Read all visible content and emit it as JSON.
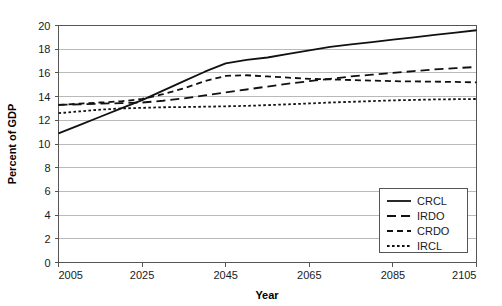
{
  "chart_data": {
    "type": "line",
    "title": "",
    "xlabel": "Year",
    "ylabel": "Percent of GDP",
    "xlim": [
      2005,
      2105
    ],
    "ylim": [
      0,
      20
    ],
    "xticks": [
      2005,
      2025,
      2045,
      2065,
      2085,
      2105
    ],
    "yticks": [
      0,
      2,
      4,
      6,
      8,
      10,
      12,
      14,
      16,
      18,
      20
    ],
    "grid": "horizontal",
    "legend_position": "bottom-right",
    "x": [
      2005,
      2010,
      2015,
      2020,
      2025,
      2030,
      2035,
      2040,
      2045,
      2050,
      2055,
      2060,
      2065,
      2070,
      2075,
      2080,
      2085,
      2090,
      2095,
      2100,
      2105
    ],
    "series": [
      {
        "name": "CRCL",
        "style": "solid",
        "values": [
          10.9,
          11.6,
          12.3,
          13.0,
          13.7,
          14.5,
          15.3,
          16.1,
          16.8,
          17.1,
          17.3,
          17.6,
          17.9,
          18.2,
          18.4,
          18.6,
          18.8,
          19.0,
          19.2,
          19.4,
          19.6
        ]
      },
      {
        "name": "IRDO",
        "style": "long-dash",
        "values": [
          13.3,
          13.35,
          13.4,
          13.45,
          13.5,
          13.65,
          13.85,
          14.1,
          14.35,
          14.6,
          14.85,
          15.1,
          15.3,
          15.5,
          15.7,
          15.85,
          16.0,
          16.15,
          16.3,
          16.4,
          16.5
        ]
      },
      {
        "name": "CRDO",
        "style": "medium-dash",
        "values": [
          13.3,
          13.4,
          13.5,
          13.6,
          13.8,
          14.2,
          14.7,
          15.3,
          15.75,
          15.8,
          15.7,
          15.6,
          15.5,
          15.45,
          15.4,
          15.35,
          15.3,
          15.28,
          15.26,
          15.24,
          15.2
        ]
      },
      {
        "name": "IRCL",
        "style": "dotted",
        "values": [
          12.6,
          12.75,
          12.9,
          13.0,
          13.05,
          13.1,
          13.12,
          13.15,
          13.18,
          13.22,
          13.28,
          13.35,
          13.42,
          13.5,
          13.56,
          13.62,
          13.68,
          13.72,
          13.76,
          13.78,
          13.8
        ]
      }
    ],
    "colors": {
      "series_line": "#111111",
      "grid": "#b9b9b9",
      "frame": "#555555",
      "background": "#ffffff",
      "text": "#1a1a1a"
    }
  }
}
